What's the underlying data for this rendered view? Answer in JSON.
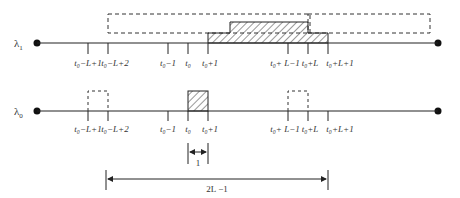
{
  "diagram": {
    "lines": [
      {
        "id": "lambda1",
        "label": "λ",
        "subscript": "1",
        "y": 43
      },
      {
        "id": "lambda0",
        "label": "λ",
        "subscript": "0",
        "y": 111
      }
    ],
    "ticks": [
      {
        "id": "t0-L+1",
        "x": 88,
        "label": "t₀−L+1"
      },
      {
        "id": "t0-L+2",
        "x": 108,
        "label": "t₀−L+2"
      },
      {
        "id": "t0-1",
        "x": 168,
        "label": "t₀−1"
      },
      {
        "id": "t0",
        "x": 188,
        "label": "t₀"
      },
      {
        "id": "t0+1",
        "x": 208,
        "label": "t₀+1"
      },
      {
        "id": "t0+L-1",
        "x": 288,
        "label": "t₀+ L−1"
      },
      {
        "id": "t0+L",
        "x": 308,
        "label": "t₀+L"
      },
      {
        "id": "t0+L+1",
        "x": 328,
        "label": "t₀+L+1"
      }
    ],
    "dimensions": [
      {
        "id": "unit-width",
        "label": "1",
        "from_x": 188,
        "to_x": 208,
        "y": 152
      },
      {
        "id": "window-width",
        "label": "2L −1",
        "from_x": 105,
        "to_x": 328,
        "y": 180
      }
    ],
    "colors": {
      "stroke": "#222222",
      "dashed": "#333333",
      "hatch": "#333333",
      "text": "#333333",
      "background": "#ffffff"
    }
  }
}
